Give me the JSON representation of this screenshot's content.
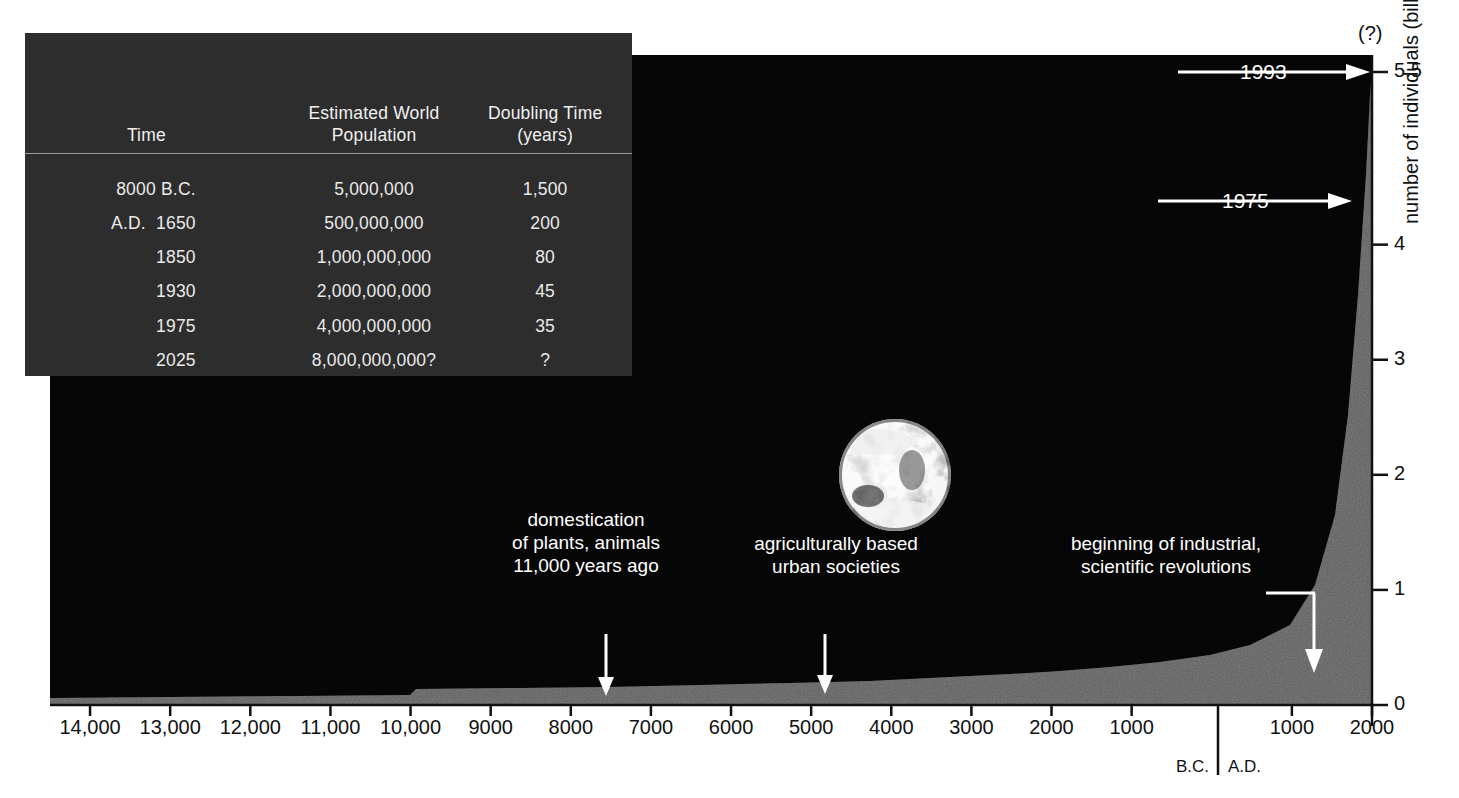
{
  "table": {
    "headers": [
      "Time",
      "Estimated World\nPopulation",
      "Doubling Time\n(years)"
    ],
    "header_time": "Time",
    "header_pop_l1": "Estimated World",
    "header_pop_l2": "Population",
    "header_dbl_l1": "Doubling Time",
    "header_dbl_l2": "(years)",
    "rows": [
      {
        "time": "8000 B.C.",
        "population": "5,000,000",
        "doubling": "1,500"
      },
      {
        "time": "A.D.  1650",
        "population": "500,000,000",
        "doubling": "200"
      },
      {
        "time": "1850",
        "population": "1,000,000,000",
        "doubling": "80"
      },
      {
        "time": "1930",
        "population": "2,000,000,000",
        "doubling": "45"
      },
      {
        "time": "1975",
        "population": "4,000,000,000",
        "doubling": "35"
      },
      {
        "time": "2025",
        "population": "8,000,000,000?",
        "doubling": "?"
      }
    ]
  },
  "chart_data": {
    "type": "area",
    "title": "",
    "xlabel": "",
    "ylabel": "number of individuals (billions)",
    "y_axis_title": "number of individuals (billions)",
    "y_ticks": [
      "0",
      "1",
      "2",
      "3",
      "4",
      "5.5"
    ],
    "y_tick_values": [
      0,
      1,
      2,
      3,
      4,
      5.5
    ],
    "ylim": [
      0,
      5.5
    ],
    "uncertainty_label": "(?)",
    "x_ticks": [
      "14,000",
      "13,000",
      "12,000",
      "11,000",
      "10,000",
      "9000",
      "8000",
      "7000",
      "6000",
      "5000",
      "4000",
      "3000",
      "2000",
      "1000",
      "1000",
      "2000"
    ],
    "x_tick_values": [
      -14000,
      -13000,
      -12000,
      -11000,
      -10000,
      -9000,
      -8000,
      -7000,
      -6000,
      -5000,
      -4000,
      -3000,
      -2000,
      -1000,
      1000,
      2000
    ],
    "era_labels": [
      "B.C.",
      "A.D."
    ],
    "x": [
      -14500,
      -11000,
      -9000,
      -7000,
      -5000,
      -3000,
      -2000,
      -1000,
      0,
      500,
      1000,
      1300,
      1500,
      1650,
      1750,
      1850,
      1900,
      1930,
      1950,
      1975,
      1993
    ],
    "values": [
      0.005,
      0.006,
      0.008,
      0.015,
      0.03,
      0.05,
      0.08,
      0.11,
      0.17,
      0.19,
      0.27,
      0.36,
      0.42,
      0.5,
      0.7,
      1.0,
      1.6,
      2.0,
      2.5,
      4.0,
      5.5
    ],
    "grid": false,
    "legend": "none",
    "markers": [
      {
        "label": "1993",
        "value": 5.5
      },
      {
        "label": "1975",
        "value": 4
      }
    ],
    "annotations": [
      {
        "id": "domestication",
        "text": "domestication\nof plants, animals\n11,000 years ago",
        "points_to_x": -9000
      },
      {
        "id": "urban",
        "text": "agriculturally based\nurban societies",
        "points_to_x": -5000
      },
      {
        "id": "industrial",
        "text": "beginning of industrial,\nscientific revolutions",
        "points_to_x": 1750
      }
    ]
  },
  "graphic": {
    "earth_photo": "earth-photograph"
  }
}
